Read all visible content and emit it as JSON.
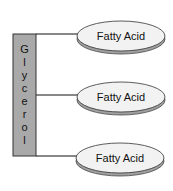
{
  "diagram": {
    "type": "triglyceride-structure",
    "backbone": {
      "label": "Glycerol",
      "letters": [
        "G",
        "l",
        "y",
        "c",
        "e",
        "r",
        "o",
        "l"
      ],
      "fill": "#a9a9a9",
      "stroke": "#333333"
    },
    "fatty_acids": [
      {
        "label": "Fatty Acid"
      },
      {
        "label": "Fatty Acid"
      },
      {
        "label": "Fatty Acid"
      }
    ],
    "colors": {
      "ellipse_fill": "#f2f2f2",
      "ellipse_shadow": "#a0a0a0",
      "line": "#111111"
    }
  }
}
